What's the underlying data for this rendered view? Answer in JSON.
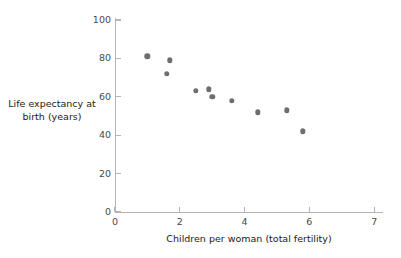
{
  "chart_data": {
    "type": "scatter",
    "title": "",
    "xlabel": "Children per woman (total fertility)",
    "ylabel": "Life expectancy at birth (years)",
    "xlim": [
      0,
      8.3
    ],
    "ylim": [
      0,
      104
    ],
    "grid": false,
    "legend": null,
    "point_color": "#6e6e72",
    "axis_color": "#b4b4b4",
    "xticks": [
      {
        "value": 0,
        "label": "0"
      },
      {
        "value": 2,
        "label": "2"
      },
      {
        "value": 4,
        "label": "4"
      },
      {
        "value": 6,
        "label": "6"
      },
      {
        "value": 8,
        "label": "7"
      }
    ],
    "yticks": [
      {
        "value": 0,
        "label": "0"
      },
      {
        "value": 20,
        "label": "20"
      },
      {
        "value": 40,
        "label": "40"
      },
      {
        "value": 60,
        "label": "60"
      },
      {
        "value": 80,
        "label": "80"
      },
      {
        "value": 100,
        "label": "100"
      }
    ],
    "x": [
      1.0,
      1.6,
      1.7,
      2.5,
      2.9,
      3.0,
      3.6,
      4.4,
      5.3,
      5.8
    ],
    "y": [
      81,
      72,
      79,
      63,
      64,
      60,
      58,
      52,
      53,
      42
    ],
    "points": [
      {
        "x": 1.0,
        "y": 81
      },
      {
        "x": 1.6,
        "y": 72
      },
      {
        "x": 1.7,
        "y": 79
      },
      {
        "x": 2.5,
        "y": 63
      },
      {
        "x": 2.9,
        "y": 64
      },
      {
        "x": 3.0,
        "y": 60
      },
      {
        "x": 3.6,
        "y": 58
      },
      {
        "x": 4.4,
        "y": 52
      },
      {
        "x": 5.3,
        "y": 53
      },
      {
        "x": 5.8,
        "y": 42
      }
    ]
  },
  "labels": {
    "y_axis_line1": "Life expectancy at",
    "y_axis_line2": "birth (years)"
  }
}
